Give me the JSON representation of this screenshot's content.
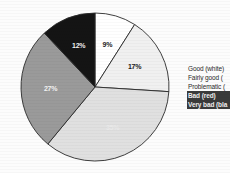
{
  "chart_data": {
    "type": "pie",
    "title": "",
    "categories": [
      "Good (white)",
      "Fairly good (light grey)",
      "Problematic (grey)",
      "Bad (red)",
      "Very bad (black)"
    ],
    "values": [
      9,
      17,
      35,
      27,
      12
    ],
    "value_labels": [
      "9%",
      "17%",
      "35%",
      "27%",
      "12%"
    ],
    "colors": [
      "#ffffff",
      "#f0f0f0",
      "#e0e0e0",
      "#9a9a9a",
      "#141414"
    ],
    "legend_position": "right",
    "grid": false,
    "start_angle_deg": 0,
    "direction": "clockwise"
  },
  "chart": {
    "slices": [
      {
        "label": "Good (white)",
        "value": 9,
        "display": "9%",
        "color": "#ffffff",
        "label_tone": "dark"
      },
      {
        "label": "Fairly good",
        "value": 17,
        "display": "17%",
        "color": "#f0f0f0",
        "label_tone": "dark"
      },
      {
        "label": "Problematic",
        "value": 35,
        "display": "35%",
        "color": "#e0e0e0",
        "label_tone": "faint"
      },
      {
        "label": "Bad",
        "value": 27,
        "display": "27%",
        "color": "#9a9a9a",
        "label_tone": "light"
      },
      {
        "label": "Very bad",
        "value": 12,
        "display": "12%",
        "color": "#141414",
        "label_tone": "light"
      }
    ]
  },
  "legend": {
    "items": [
      {
        "text": "Good (white)",
        "selected": false
      },
      {
        "text": "Fairly good (",
        "selected": false
      },
      {
        "text": "Problematic (",
        "selected": false
      },
      {
        "text": "Bad (red)",
        "selected": true
      },
      {
        "text": "Very bad (bla",
        "selected": true
      }
    ]
  }
}
